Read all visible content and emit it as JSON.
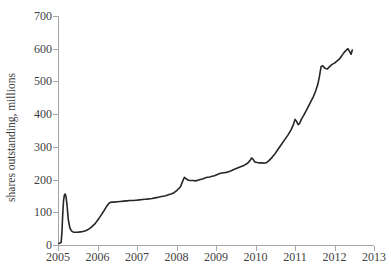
{
  "chart_data": {
    "type": "line",
    "title": "",
    "xlabel": "",
    "ylabel": "shares outstanding, millions",
    "xlim": [
      2005,
      2013
    ],
    "ylim": [
      0,
      700
    ],
    "grid": false,
    "legend": "none",
    "line_color": "#262626",
    "axis_color": "#a6a6a6",
    "text_color": "#3f3f3f",
    "x_ticks": [
      "2005",
      "2006",
      "2007",
      "2008",
      "2009",
      "2010",
      "2011",
      "2012",
      "2013"
    ],
    "y_ticks": [
      "0",
      "100",
      "200",
      "300",
      "400",
      "500",
      "600",
      "700"
    ],
    "series": [
      {
        "name": "shares outstanding",
        "x": [
          2005.02,
          2005.05,
          2005.08,
          2005.1,
          2005.12,
          2005.14,
          2005.16,
          2005.18,
          2005.2,
          2005.23,
          2005.26,
          2005.3,
          2005.34,
          2005.38,
          2005.42,
          2005.46,
          2005.5,
          2005.56,
          2005.62,
          2005.68,
          2005.74,
          2005.8,
          2005.86,
          2005.92,
          2005.98,
          2006.04,
          2006.1,
          2006.16,
          2006.22,
          2006.28,
          2006.32,
          2006.36,
          2006.42,
          2006.5,
          2006.58,
          2006.66,
          2006.74,
          2006.82,
          2006.9,
          2006.98,
          2007.06,
          2007.14,
          2007.22,
          2007.3,
          2007.38,
          2007.46,
          2007.54,
          2007.62,
          2007.7,
          2007.78,
          2007.86,
          2007.94,
          2008.02,
          2008.1,
          2008.16,
          2008.2,
          2008.24,
          2008.3,
          2008.36,
          2008.42,
          2008.48,
          2008.54,
          2008.6,
          2008.66,
          2008.72,
          2008.78,
          2008.84,
          2008.9,
          2008.96,
          2009.02,
          2009.08,
          2009.14,
          2009.2,
          2009.26,
          2009.32,
          2009.4,
          2009.48,
          2009.56,
          2009.64,
          2009.72,
          2009.8,
          2009.86,
          2009.9,
          2009.94,
          2009.98,
          2010.04,
          2010.1,
          2010.16,
          2010.22,
          2010.28,
          2010.34,
          2010.42,
          2010.5,
          2010.58,
          2010.66,
          2010.74,
          2010.82,
          2010.9,
          2010.96,
          2011.0,
          2011.04,
          2011.08,
          2011.12,
          2011.16,
          2011.22,
          2011.28,
          2011.34,
          2011.4,
          2011.46,
          2011.52,
          2011.58,
          2011.62,
          2011.66,
          2011.7,
          2011.76,
          2011.82,
          2011.88,
          2011.94,
          2012.0,
          2012.06,
          2012.12,
          2012.18,
          2012.24,
          2012.3,
          2012.34,
          2012.38,
          2012.42,
          2012.45
        ],
        "y": [
          5,
          6,
          8,
          40,
          95,
          135,
          152,
          156,
          150,
          120,
          78,
          52,
          43,
          40,
          39,
          39,
          39,
          40,
          41,
          43,
          46,
          50,
          56,
          63,
          72,
          82,
          93,
          104,
          116,
          126,
          130,
          131,
          131,
          132,
          133,
          134,
          135,
          136,
          136,
          137,
          138,
          139,
          140,
          141,
          142,
          144,
          146,
          148,
          150,
          153,
          156,
          160,
          168,
          178,
          196,
          207,
          203,
          198,
          197,
          197,
          196,
          198,
          200,
          202,
          205,
          207,
          208,
          210,
          212,
          215,
          218,
          220,
          221,
          222,
          224,
          228,
          232,
          236,
          240,
          244,
          250,
          258,
          266,
          262,
          254,
          252,
          251,
          251,
          250,
          252,
          258,
          268,
          280,
          294,
          308,
          322,
          336,
          352,
          368,
          384,
          378,
          368,
          372,
          384,
          396,
          410,
          424,
          438,
          452,
          470,
          492,
          516,
          545,
          548,
          540,
          538,
          546,
          552,
          556,
          562,
          568,
          578,
          588,
          596,
          600,
          592,
          583,
          596
        ]
      }
    ]
  },
  "axis_labels": {
    "y_title": "shares outstanding, millions"
  }
}
